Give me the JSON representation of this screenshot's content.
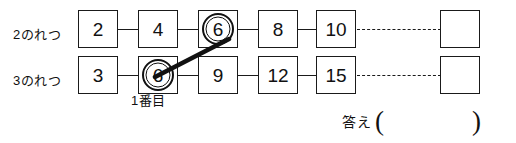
{
  "worksheet": {
    "rows": [
      {
        "id": "row-2",
        "label": "2のれつ",
        "boxes": [
          {
            "value": "2",
            "circled": false,
            "empty": false
          },
          {
            "value": "4",
            "circled": false,
            "empty": false
          },
          {
            "value": "6",
            "circled": true,
            "empty": false
          },
          {
            "value": "8",
            "circled": false,
            "empty": false
          },
          {
            "value": "10",
            "circled": false,
            "empty": false
          },
          {
            "value": "",
            "circled": false,
            "empty": true
          }
        ]
      },
      {
        "id": "row-3",
        "label": "3のれつ",
        "boxes": [
          {
            "value": "3",
            "circled": false,
            "empty": false
          },
          {
            "value": "6",
            "circled": true,
            "empty": false
          },
          {
            "value": "9",
            "circled": false,
            "empty": false
          },
          {
            "value": "12",
            "circled": false,
            "empty": false
          },
          {
            "value": "15",
            "circled": false,
            "empty": false
          },
          {
            "value": "",
            "circled": false,
            "empty": true
          }
        ]
      }
    ],
    "caption_first": "1番目",
    "answer": {
      "label": "答え",
      "paren_open": "(",
      "paren_close": ")",
      "value": ""
    },
    "colors": {
      "ink": "#1a1a1a",
      "paper": "#ffffff"
    }
  }
}
